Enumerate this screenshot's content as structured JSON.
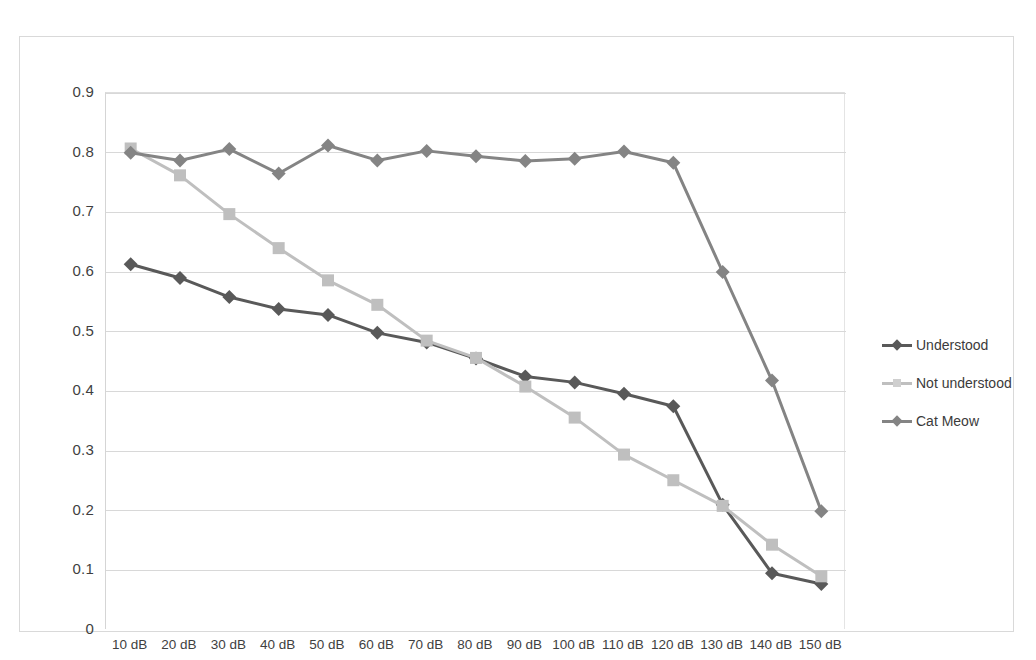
{
  "chart_data": {
    "type": "line",
    "title": "",
    "xlabel": "",
    "ylabel": "",
    "categories": [
      "10 dB",
      "20 dB",
      "30 dB",
      "40 dB",
      "50 dB",
      "60 dB",
      "70 dB",
      "80 dB",
      "90 dB",
      "100 dB",
      "110 dB",
      "120 dB",
      "130 dB",
      "140 dB",
      "150 dB"
    ],
    "ylim": [
      0,
      0.9
    ],
    "ytick_labels": [
      "0.9",
      "0.8",
      "0.7",
      "0.6",
      "0.5",
      "0.4",
      "0.3",
      "0.2",
      "0.1",
      "0"
    ],
    "ytick_values": [
      0.9,
      0.8,
      0.7,
      0.6,
      0.5,
      0.4,
      0.3,
      0.2,
      0.1,
      0
    ],
    "grid": "horizontal",
    "legend_position": "right",
    "series": [
      {
        "name": "Understood",
        "color": "#595959",
        "marker": "diamond",
        "values": [
          0.613,
          0.59,
          0.558,
          0.538,
          0.528,
          0.498,
          0.482,
          0.455,
          0.425,
          0.415,
          0.396,
          0.375,
          0.21,
          0.095,
          0.077
        ]
      },
      {
        "name": "Not understood",
        "color": "#bfbfbf",
        "marker": "square",
        "values": [
          0.807,
          0.762,
          0.697,
          0.64,
          0.586,
          0.545,
          0.485,
          0.456,
          0.408,
          0.356,
          0.294,
          0.251,
          0.208,
          0.143,
          0.09
        ]
      },
      {
        "name": "Cat Meow",
        "color": "#848484",
        "marker": "diamond",
        "values": [
          0.8,
          0.787,
          0.806,
          0.765,
          0.812,
          0.787,
          0.803,
          0.794,
          0.786,
          0.79,
          0.802,
          0.783,
          0.6,
          0.418,
          0.199
        ]
      }
    ]
  },
  "legend": {
    "entries": [
      {
        "label": "Understood"
      },
      {
        "label": "Not understood"
      },
      {
        "label": "Cat Meow"
      }
    ]
  },
  "artifact": {
    "top_text": ""
  }
}
